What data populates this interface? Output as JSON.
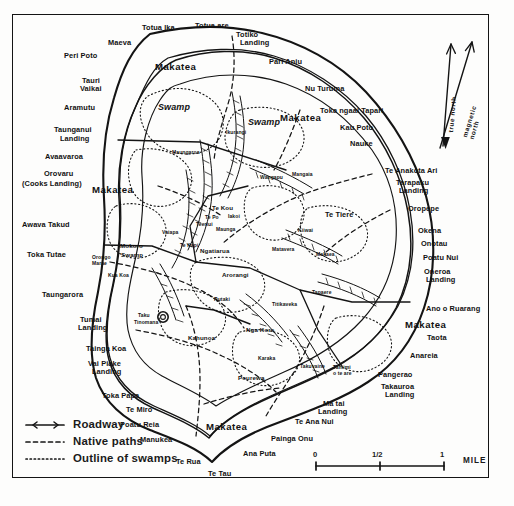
{
  "map": {
    "title": "Rarotonga",
    "ink_color": "#141414",
    "paper_color": "#fdfdfc"
  },
  "legend": {
    "items": [
      {
        "key": "solid-line",
        "label": "Roadway"
      },
      {
        "key": "dashed-line",
        "label": "Native paths"
      },
      {
        "key": "dotted-line",
        "label": "Outline of swamps"
      }
    ]
  },
  "scale_bar": {
    "ticks": [
      "0",
      "1/2",
      "1"
    ],
    "unit": "MILE"
  },
  "compass": {
    "true_north": "true north",
    "magnetic_north": "magnetic north"
  },
  "coastal_labels": [
    {
      "text": "Totua Ika",
      "x": 142,
      "y": 24,
      "cls": "coast"
    },
    {
      "text": "Totua are",
      "x": 195,
      "y": 22,
      "cls": "coast"
    },
    {
      "text": "Totiko",
      "x": 236,
      "y": 31,
      "cls": "coast"
    },
    {
      "text": "Landing",
      "x": 240,
      "y": 39,
      "cls": "coast"
    },
    {
      "text": "Maeva",
      "x": 108,
      "y": 39,
      "cls": "coast"
    },
    {
      "text": "Peri Poto",
      "x": 64,
      "y": 52,
      "cls": "coast"
    },
    {
      "text": "Pari Aniu",
      "x": 269,
      "y": 58,
      "cls": "coast"
    },
    {
      "text": "Tauri",
      "x": 82,
      "y": 77,
      "cls": "coast"
    },
    {
      "text": "Vaikai",
      "x": 80,
      "y": 85,
      "cls": "coast"
    },
    {
      "text": "Nu Turuma",
      "x": 305,
      "y": 85,
      "cls": "coast"
    },
    {
      "text": "Aramutu",
      "x": 64,
      "y": 104,
      "cls": "coast"
    },
    {
      "text": "Toka ngaai Tapari",
      "x": 320,
      "y": 107,
      "cls": "coast"
    },
    {
      "text": "Kau Poto",
      "x": 340,
      "y": 124,
      "cls": "coast"
    },
    {
      "text": "Taunganui",
      "x": 54,
      "y": 126,
      "cls": "coast"
    },
    {
      "text": "Landing",
      "x": 60,
      "y": 135,
      "cls": "coast"
    },
    {
      "text": "Nauke",
      "x": 350,
      "y": 140,
      "cls": "coast"
    },
    {
      "text": "Avaavaroa",
      "x": 45,
      "y": 153,
      "cls": "coast"
    },
    {
      "text": "Te Anakota Ari",
      "x": 385,
      "y": 167,
      "cls": "coast"
    },
    {
      "text": "Tarapaku",
      "x": 396,
      "y": 179,
      "cls": "coast"
    },
    {
      "text": "Landing",
      "x": 399,
      "y": 187,
      "cls": "coast"
    },
    {
      "text": "Orovaru",
      "x": 44,
      "y": 170,
      "cls": "coast"
    },
    {
      "text": "(Cooks Landing)",
      "x": 22,
      "y": 180,
      "cls": "coast"
    },
    {
      "text": "Oropepe",
      "x": 408,
      "y": 205,
      "cls": "coast"
    },
    {
      "text": "Awava Takud",
      "x": 22,
      "y": 221,
      "cls": "coast"
    },
    {
      "text": "Okena",
      "x": 418,
      "y": 227,
      "cls": "coast"
    },
    {
      "text": "Onotau",
      "x": 421,
      "y": 240,
      "cls": "coast"
    },
    {
      "text": "Toka Tutae",
      "x": 27,
      "y": 251,
      "cls": "coast"
    },
    {
      "text": "Poatu Nui",
      "x": 423,
      "y": 254,
      "cls": "coast"
    },
    {
      "text": "Oneroa",
      "x": 424,
      "y": 268,
      "cls": "coast"
    },
    {
      "text": "Landing",
      "x": 426,
      "y": 276,
      "cls": "coast"
    },
    {
      "text": "Taungarora",
      "x": 42,
      "y": 291,
      "cls": "coast"
    },
    {
      "text": "Ano o Ruarang",
      "x": 426,
      "y": 305,
      "cls": "coast"
    },
    {
      "text": "Tumai",
      "x": 80,
      "y": 316,
      "cls": "coast"
    },
    {
      "text": "Landing",
      "x": 78,
      "y": 324,
      "cls": "coast"
    },
    {
      "text": "Taota",
      "x": 427,
      "y": 334,
      "cls": "coast"
    },
    {
      "text": "Tainga Koa",
      "x": 86,
      "y": 345,
      "cls": "coast"
    },
    {
      "text": "Anareia",
      "x": 410,
      "y": 352,
      "cls": "coast"
    },
    {
      "text": "Vai Piake",
      "x": 88,
      "y": 360,
      "cls": "coast"
    },
    {
      "text": "Landing",
      "x": 92,
      "y": 368,
      "cls": "coast"
    },
    {
      "text": "Pangerao",
      "x": 378,
      "y": 371,
      "cls": "coast"
    },
    {
      "text": "Tamimi",
      "x": 333,
      "y": 365,
      "cls": "tiny"
    },
    {
      "text": "o te are",
      "x": 333,
      "y": 371,
      "cls": "tiny"
    },
    {
      "text": "Takauroa",
      "x": 381,
      "y": 383,
      "cls": "coast"
    },
    {
      "text": "Landing",
      "x": 385,
      "y": 391,
      "cls": "coast"
    },
    {
      "text": "Toka Papa",
      "x": 102,
      "y": 392,
      "cls": "coast"
    },
    {
      "text": "Te Miro",
      "x": 126,
      "y": 406,
      "cls": "coast"
    },
    {
      "text": "Ma tai",
      "x": 323,
      "y": 400,
      "cls": "coast"
    },
    {
      "text": "Landing",
      "x": 318,
      "y": 408,
      "cls": "coast"
    },
    {
      "text": "Te Ana Nui",
      "x": 295,
      "y": 418,
      "cls": "coast"
    },
    {
      "text": "Poatu Reia",
      "x": 120,
      "y": 421,
      "cls": "coast"
    },
    {
      "text": "Painga Onu",
      "x": 271,
      "y": 435,
      "cls": "coast"
    },
    {
      "text": "Manukea",
      "x": 140,
      "y": 436,
      "cls": "coast"
    },
    {
      "text": "Ana Puta",
      "x": 243,
      "y": 450,
      "cls": "coast"
    },
    {
      "text": "Te Rua",
      "x": 176,
      "y": 458,
      "cls": "coast"
    },
    {
      "text": "Te Tau",
      "x": 208,
      "y": 470,
      "cls": "coast"
    }
  ],
  "region_labels": [
    {
      "text": "Makatea",
      "x": 155,
      "y": 62,
      "cls": "big"
    },
    {
      "text": "Makatea",
      "x": 280,
      "y": 113,
      "cls": "big"
    },
    {
      "text": "Makatea",
      "x": 92,
      "y": 185,
      "cls": "big"
    },
    {
      "text": "Makatea",
      "x": 405,
      "y": 320,
      "cls": "big"
    },
    {
      "text": "Makatea",
      "x": 206,
      "y": 422,
      "cls": "big"
    },
    {
      "text": "Swamp",
      "x": 158,
      "y": 103,
      "cls": "swamp"
    },
    {
      "text": "Swamp",
      "x": 248,
      "y": 118,
      "cls": "swamp"
    },
    {
      "text": "Swamp",
      "x": 121,
      "y": 252,
      "cls": "inner"
    },
    {
      "text": "Te Tiere",
      "x": 325,
      "y": 211,
      "cls": "coast"
    }
  ],
  "interior_labels": [
    {
      "text": "Te Kou",
      "x": 212,
      "y": 205,
      "cls": "inner"
    },
    {
      "text": "Te Po",
      "x": 205,
      "y": 215,
      "cls": "tiny"
    },
    {
      "text": "Iakoi",
      "x": 228,
      "y": 214,
      "cls": "tiny"
    },
    {
      "text": "Teeriui",
      "x": 196,
      "y": 222,
      "cls": "tiny"
    },
    {
      "text": "Maunga",
      "x": 216,
      "y": 227,
      "cls": "tiny"
    },
    {
      "text": "Vaiapa",
      "x": 162,
      "y": 230,
      "cls": "tiny"
    },
    {
      "text": "Te Kapi",
      "x": 180,
      "y": 243,
      "cls": "tiny"
    },
    {
      "text": "Ngatiarua",
      "x": 200,
      "y": 248,
      "cls": "inner"
    },
    {
      "text": "Mokoro",
      "x": 120,
      "y": 243,
      "cls": "inner"
    },
    {
      "text": "Orongo",
      "x": 92,
      "y": 255,
      "cls": "tiny"
    },
    {
      "text": "Marae",
      "x": 92,
      "y": 261,
      "cls": "tiny"
    },
    {
      "text": "Kua Koa",
      "x": 108,
      "y": 273,
      "cls": "tiny"
    },
    {
      "text": "Arorangi",
      "x": 222,
      "y": 272,
      "cls": "inner"
    },
    {
      "text": "Taku",
      "x": 138,
      "y": 313,
      "cls": "tiny"
    },
    {
      "text": "Tinomana",
      "x": 134,
      "y": 320,
      "cls": "tiny"
    },
    {
      "text": "Kahunoa",
      "x": 188,
      "y": 335,
      "cls": "inner"
    },
    {
      "text": "Nga Kore",
      "x": 246,
      "y": 327,
      "cls": "inner"
    },
    {
      "text": "Karaka",
      "x": 258,
      "y": 356,
      "cls": "tiny"
    },
    {
      "text": "Pourewa",
      "x": 238,
      "y": 375,
      "cls": "inner"
    },
    {
      "text": "Takuvaine",
      "x": 300,
      "y": 364,
      "cls": "tiny"
    },
    {
      "text": "Makaea",
      "x": 316,
      "y": 252,
      "cls": "tiny"
    },
    {
      "text": "Matavera",
      "x": 272,
      "y": 247,
      "cls": "tiny"
    },
    {
      "text": "Kiiwai",
      "x": 298,
      "y": 228,
      "cls": "tiny"
    },
    {
      "text": "Wangapu",
      "x": 260,
      "y": 175,
      "cls": "tiny"
    },
    {
      "text": "Mangaia",
      "x": 292,
      "y": 172,
      "cls": "tiny"
    },
    {
      "text": "Maungaroa",
      "x": 172,
      "y": 150,
      "cls": "tiny"
    },
    {
      "text": "Ikurangi",
      "x": 226,
      "y": 130,
      "cls": "tiny"
    },
    {
      "text": "Tapaere",
      "x": 312,
      "y": 290,
      "cls": "tiny"
    },
    {
      "text": "Rutaki",
      "x": 214,
      "y": 297,
      "cls": "tiny"
    },
    {
      "text": "Titikaveka",
      "x": 272,
      "y": 302,
      "cls": "tiny"
    }
  ]
}
